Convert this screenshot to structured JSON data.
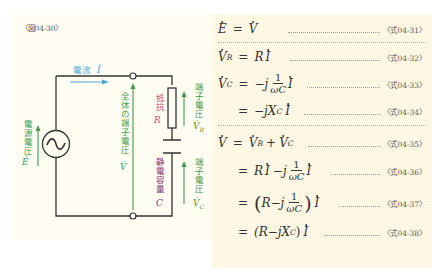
{
  "figure": {
    "label": "〈図04-30〉",
    "colors": {
      "panel_left_bg": "#fffdf2",
      "panel_right_bg": "#fdf7e4",
      "wire": "#333333",
      "current_blue": "#4aa6d8",
      "voltage_green": "#3f9a4a",
      "resistor_red": "#d9456b",
      "capacitor_purple": "#8a2f73"
    },
    "circuit": {
      "current_label": "電流",
      "current_symbol": "İ",
      "source_label": "電源電圧",
      "source_symbol": "Ė",
      "source_icon": "ac-source-icon",
      "total_voltage_label": "全体の端子電圧",
      "total_voltage_symbol": "V̇",
      "resistor_label": "抵抗",
      "resistor_symbol": "R",
      "resistor_voltage_label": "端子電圧",
      "resistor_voltage_symbol": "V̇",
      "resistor_voltage_subscript": "R",
      "capacitor_label": "静電容量",
      "capacitor_symbol": "C",
      "capacitor_voltage_label": "端子電圧",
      "capacitor_voltage_symbol": "V̇",
      "capacitor_voltage_subscript": "C"
    }
  },
  "equations": [
    {
      "id": "eq31",
      "lhs": "E",
      "rhs": "V",
      "ref": "〈式04-31〉"
    },
    {
      "id": "eq32",
      "lhs": "V",
      "lhs_sub": "R",
      "rhs": "R I",
      "ref": "〈式04-32〉"
    },
    {
      "id": "eq33",
      "lhs": "V",
      "lhs_sub": "C",
      "rhs_prefix": "−j",
      "frac_num": "1",
      "frac_den": "ωC",
      "rhs_suffix": "I",
      "ref": "〈式04-33〉"
    },
    {
      "id": "eq34",
      "rhs": "−jX",
      "rhs_sub": "C",
      "rhs_suffix": "I",
      "ref": "〈式04-34〉"
    },
    {
      "id": "eq35",
      "lhs": "V",
      "rhs_a": "V",
      "rhs_a_sub": "R",
      "op": "+",
      "rhs_b": "V",
      "rhs_b_sub": "C",
      "ref": "〈式04-35〉"
    },
    {
      "id": "eq36",
      "rhs_prefix": "R I −j",
      "frac_num": "1",
      "frac_den": "ωC",
      "rhs_suffix": "I",
      "ref": "〈式04-36〉"
    },
    {
      "id": "eq37",
      "rhs_prefix": "R−j",
      "frac_num": "1",
      "frac_den": "ωC",
      "rhs_suffix": "I",
      "ref": "〈式04-37〉"
    },
    {
      "id": "eq38",
      "rhs": "(R−jX",
      "rhs_sub": "C",
      "rhs_close": ")",
      "rhs_suffix": "I",
      "ref": "〈式04-38〉"
    }
  ],
  "symbols": {
    "equals": "=",
    "R": "R",
    "I": "I",
    "E": "E",
    "V": "V",
    "minus_j": "−j",
    "jX": "jX",
    "paren_open": "(",
    "paren_close": ")",
    "minus": "−",
    "plus": "+"
  }
}
